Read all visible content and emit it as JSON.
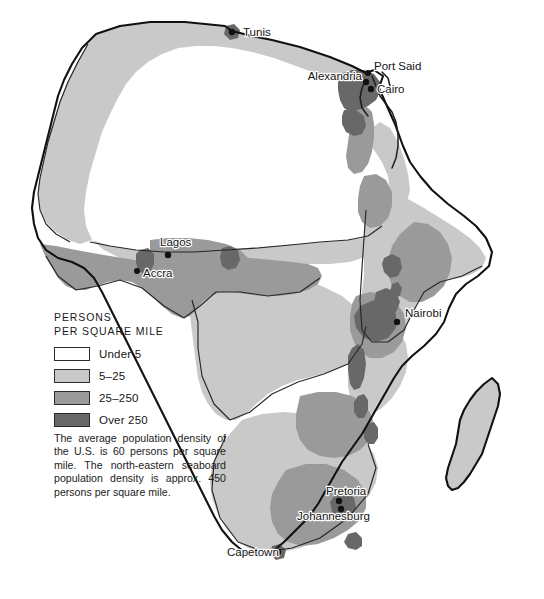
{
  "map": {
    "title": "Africa population density",
    "background_color": "#ffffff",
    "coastline_color": "#111111"
  },
  "legend": {
    "title_line1": "PERSONS",
    "title_line2": "PER SQUARE MILE",
    "items": [
      {
        "label": "Under 5",
        "color": "#ffffff"
      },
      {
        "label": "5–25",
        "color": "#c9c9c9"
      },
      {
        "label": "25–250",
        "color": "#9a9a9a"
      },
      {
        "label": "Over 250",
        "color": "#686868"
      }
    ]
  },
  "note": {
    "text": "The average population density of the U.S. is 60 persons per square mile. The north-eastern seaboard population density is approx. 450 persons per square mile."
  },
  "cities": [
    {
      "name": "Tunis",
      "label_x": 243,
      "label_y": 35,
      "dot_x": 232,
      "dot_y": 32,
      "anchor": "start"
    },
    {
      "name": "Alexandria",
      "label_x": 364,
      "label_y": 79,
      "dot_x": 366,
      "dot_y": 82,
      "anchor": "end"
    },
    {
      "name": "Port Said",
      "label_x": 373,
      "label_y": 69,
      "dot_x": 368,
      "dot_y": 73,
      "anchor": "start"
    },
    {
      "name": "Cairo",
      "label_x": 376,
      "label_y": 92,
      "dot_x": 371,
      "dot_y": 89,
      "anchor": "start"
    },
    {
      "name": "Lagos",
      "label_x": 161,
      "label_y": 245,
      "dot_x": 168,
      "dot_y": 255,
      "anchor": "start"
    },
    {
      "name": "Accra",
      "label_x": 143,
      "label_y": 277,
      "dot_x": 137,
      "dot_y": 271,
      "anchor": "start"
    },
    {
      "name": "Nairobi",
      "label_x": 404,
      "label_y": 317,
      "dot_x": 397,
      "dot_y": 322,
      "anchor": "start"
    },
    {
      "name": "Pretoria",
      "label_x": 327,
      "label_y": 494,
      "dot_x": 339,
      "dot_y": 501,
      "anchor": "start"
    },
    {
      "name": "Johannesburg",
      "label_x": 299,
      "label_y": 518,
      "dot_x": 341,
      "dot_y": 508,
      "anchor": "start"
    },
    {
      "name": "Capetown",
      "label_x": 229,
      "label_y": 556,
      "dot_x": 278,
      "dot_y": 552,
      "anchor": "start"
    }
  ]
}
